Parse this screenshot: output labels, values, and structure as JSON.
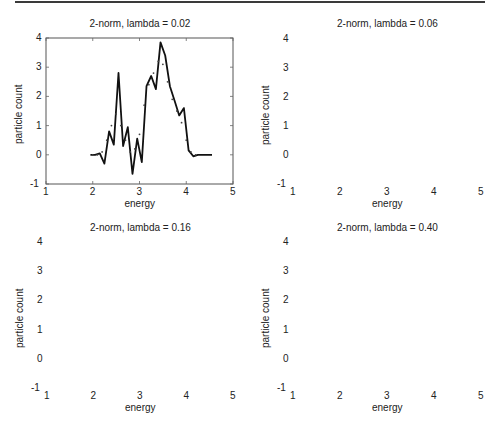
{
  "figure": {
    "caption": ""
  },
  "chart_data": [
    {
      "type": "line",
      "title": "2-norm, lambda =  0.02",
      "xlabel": "energy",
      "ylabel": "particle count",
      "xlim": [
        1,
        5
      ],
      "ylim": [
        -1,
        4
      ],
      "xticks": [
        "1",
        "2",
        "3",
        "4",
        "5"
      ],
      "yticks": [
        "-1",
        "0",
        "1",
        "2",
        "3",
        "4"
      ],
      "grid": false,
      "series": [
        {
          "name": "reconstruction",
          "style": "solid",
          "x": [
            1.95,
            2.05,
            2.15,
            2.25,
            2.35,
            2.45,
            2.55,
            2.65,
            2.75,
            2.85,
            2.95,
            3.05,
            3.15,
            3.25,
            3.35,
            3.45,
            3.55,
            3.65,
            3.75,
            3.85,
            3.95,
            4.05,
            4.15,
            4.25,
            4.35,
            4.45,
            4.55
          ],
          "y": [
            0,
            0,
            0.05,
            -0.3,
            0.8,
            0.35,
            2.8,
            0.3,
            0.95,
            -0.65,
            0.55,
            -0.25,
            2.35,
            2.7,
            2.25,
            3.85,
            3.4,
            2.35,
            1.85,
            1.35,
            1.6,
            0.15,
            -0.05,
            0,
            0,
            0,
            0
          ]
        },
        {
          "name": "true signal",
          "style": "dots",
          "x": [
            2.0,
            2.1,
            2.2,
            2.3,
            2.4,
            2.5,
            2.6,
            2.7,
            2.8,
            2.9,
            3.0,
            3.1,
            3.2,
            3.3,
            3.4,
            3.5,
            3.6,
            3.7,
            3.8,
            3.9,
            4.0,
            4.1,
            4.2
          ],
          "y": [
            0,
            0,
            0.1,
            0.5,
            1.0,
            1.4,
            1.0,
            0.5,
            0.1,
            0.2,
            0.7,
            1.7,
            2.4,
            2.8,
            3.2,
            3.1,
            2.5,
            1.9,
            1.5,
            1.1,
            0.5,
            0.1,
            0
          ]
        }
      ]
    },
    {
      "type": "line",
      "title": "2-norm, lambda =  0.06",
      "xlabel": "energy",
      "ylabel": "particle count",
      "xlim": [
        1,
        5
      ],
      "ylim": [
        -1,
        4
      ],
      "xticks": [
        "1",
        "2",
        "3",
        "4",
        "5"
      ],
      "yticks": [
        "-1",
        "0",
        "1",
        "2",
        "3",
        "4"
      ],
      "grid": false,
      "series": [
        {
          "name": "reconstruction",
          "style": "solid",
          "x": [
            1.95,
            2.05,
            2.15,
            2.25,
            2.35,
            2.45,
            2.55,
            2.65,
            2.75,
            2.85,
            2.95,
            3.05,
            3.15,
            3.25,
            3.35,
            3.45,
            3.55,
            3.65,
            3.75,
            3.85,
            3.95,
            4.05,
            4.15,
            4.25,
            4.35,
            4.45,
            4.55
          ],
          "y": [
            0,
            0,
            -0.05,
            -0.15,
            0.45,
            0.8,
            2.1,
            0.8,
            0.45,
            -0.25,
            0,
            0.05,
            2.05,
            2.55,
            2.3,
            3.45,
            3.4,
            2.2,
            1.65,
            1.35,
            1.35,
            0.2,
            -0.1,
            0,
            0,
            0,
            0
          ]
        },
        {
          "name": "true signal",
          "style": "dots",
          "x": [
            2.0,
            2.1,
            2.2,
            2.3,
            2.4,
            2.5,
            2.6,
            2.7,
            2.8,
            2.9,
            3.0,
            3.1,
            3.2,
            3.3,
            3.4,
            3.5,
            3.6,
            3.7,
            3.8,
            3.9,
            4.0,
            4.1,
            4.2
          ],
          "y": [
            0,
            0,
            0.1,
            0.5,
            1.0,
            1.4,
            1.0,
            0.5,
            0.1,
            0.2,
            0.7,
            1.7,
            2.4,
            2.8,
            3.2,
            3.1,
            2.5,
            1.9,
            1.5,
            1.1,
            0.5,
            0.1,
            0
          ]
        }
      ]
    },
    {
      "type": "line",
      "title": "2-norm, lambda =  0.16",
      "xlabel": "energy",
      "ylabel": "particle count",
      "xlim": [
        1,
        5
      ],
      "ylim": [
        -1,
        4
      ],
      "xticks": [
        "1",
        "2",
        "3",
        "4",
        "5"
      ],
      "yticks": [
        "-1",
        "0",
        "1",
        "2",
        "3",
        "4"
      ],
      "grid": false,
      "series": [
        {
          "name": "reconstruction",
          "style": "solid",
          "x": [
            1.95,
            2.05,
            2.15,
            2.25,
            2.35,
            2.45,
            2.55,
            2.65,
            2.75,
            2.85,
            2.95,
            3.05,
            3.15,
            3.25,
            3.35,
            3.45,
            3.55,
            3.65,
            3.75,
            3.85,
            3.95,
            4.05,
            4.15,
            4.25,
            4.35,
            4.45,
            4.55
          ],
          "y": [
            0,
            0,
            -0.15,
            -0.15,
            0.1,
            0.95,
            1.5,
            0.95,
            0.1,
            -0.3,
            -0.3,
            0.35,
            1.5,
            2.1,
            2.2,
            2.85,
            2.85,
            2.05,
            1.3,
            1.2,
            1.0,
            0.15,
            -0.2,
            -0.1,
            0,
            0,
            0
          ]
        },
        {
          "name": "true signal",
          "style": "dots",
          "x": [
            2.0,
            2.1,
            2.2,
            2.3,
            2.4,
            2.5,
            2.6,
            2.7,
            2.8,
            2.9,
            3.0,
            3.1,
            3.2,
            3.3,
            3.4,
            3.5,
            3.6,
            3.7,
            3.8,
            3.9,
            4.0,
            4.1,
            4.2
          ],
          "y": [
            0,
            0,
            0.1,
            0.5,
            1.0,
            1.4,
            1.0,
            0.5,
            0.1,
            0.2,
            0.7,
            1.7,
            2.4,
            2.8,
            3.2,
            3.1,
            2.5,
            1.9,
            1.5,
            1.1,
            0.5,
            0.1,
            0
          ]
        }
      ]
    },
    {
      "type": "line",
      "title": "2-norm, lambda =  0.40",
      "xlabel": "energy",
      "ylabel": "particle count",
      "xlim": [
        1,
        5
      ],
      "ylim": [
        -1,
        4
      ],
      "xticks": [
        "1",
        "2",
        "3",
        "4",
        "5"
      ],
      "yticks": [
        "-1",
        "0",
        "1",
        "2",
        "3",
        "4"
      ],
      "grid": false,
      "series": [
        {
          "name": "reconstruction",
          "style": "solid",
          "x": [
            1.95,
            2.05,
            2.15,
            2.25,
            2.35,
            2.45,
            2.55,
            2.65,
            2.75,
            2.85,
            2.95,
            3.05,
            3.15,
            3.25,
            3.35,
            3.45,
            3.55,
            3.65,
            3.75,
            3.85,
            3.95,
            4.05,
            4.15,
            4.25,
            4.35,
            4.45,
            4.55
          ],
          "y": [
            0,
            0,
            -0.15,
            -0.15,
            0.15,
            0.6,
            1.0,
            0.6,
            0.05,
            -0.3,
            -0.3,
            0.3,
            1.0,
            1.5,
            1.8,
            2.1,
            2.05,
            1.55,
            1.05,
            0.85,
            0.6,
            0.1,
            -0.15,
            -0.15,
            0,
            0,
            0
          ]
        },
        {
          "name": "true signal",
          "style": "dots",
          "x": [
            2.0,
            2.1,
            2.2,
            2.3,
            2.4,
            2.5,
            2.6,
            2.7,
            2.8,
            2.9,
            3.0,
            3.1,
            3.2,
            3.3,
            3.4,
            3.5,
            3.6,
            3.7,
            3.8,
            3.9,
            4.0,
            4.1,
            4.2
          ],
          "y": [
            0,
            0,
            0.1,
            0.5,
            1.0,
            1.4,
            1.0,
            0.5,
            0.1,
            0.2,
            0.7,
            1.7,
            2.4,
            2.8,
            3.2,
            3.1,
            2.5,
            1.9,
            1.5,
            1.1,
            0.5,
            0.1,
            0
          ]
        }
      ]
    }
  ]
}
